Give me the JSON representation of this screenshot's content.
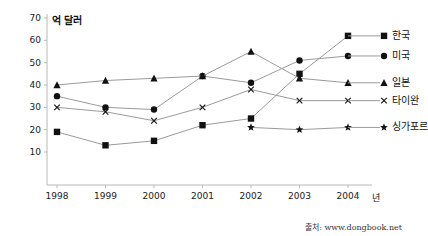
{
  "chart_data": {
    "type": "line",
    "title": "",
    "xlabel": "년",
    "ylabel": "억 달러",
    "x": [
      "1998",
      "1999",
      "2000",
      "2001",
      "2002",
      "2003",
      "2004"
    ],
    "ylim": [
      0,
      70
    ],
    "xlim": [
      "1998",
      "2004"
    ],
    "yticks": [
      10,
      20,
      30,
      40,
      50,
      60,
      70
    ],
    "grid": false,
    "legend_position": "right",
    "series": [
      {
        "name": "한국",
        "marker": "square",
        "values": [
          19,
          13,
          15,
          22,
          25,
          45,
          62
        ]
      },
      {
        "name": "미국",
        "marker": "circle",
        "values": [
          35,
          30,
          29,
          44,
          41,
          51,
          53
        ]
      },
      {
        "name": "일본",
        "marker": "triangle",
        "values": [
          40,
          42,
          43,
          44,
          55,
          43,
          41
        ]
      },
      {
        "name": "타이완",
        "marker": "cross",
        "values": [
          30,
          28,
          24,
          30,
          38,
          33,
          33
        ]
      },
      {
        "name": "싱가포르",
        "marker": "star",
        "values": [
          null,
          null,
          null,
          null,
          21,
          20,
          21
        ]
      }
    ],
    "source": "출처: www.dongbook.net"
  },
  "axis": {
    "unit_y": "억 달러",
    "unit_x": "년",
    "ytick_labels": [
      "70",
      "60",
      "50",
      "40",
      "30",
      "20",
      "10"
    ],
    "xtick_labels": [
      "1998",
      "1999",
      "2000",
      "2001",
      "2002",
      "2003",
      "2004"
    ]
  },
  "legend": {
    "items": [
      {
        "label": "한국"
      },
      {
        "label": "미국"
      },
      {
        "label": "일본"
      },
      {
        "label": "타이완"
      },
      {
        "label": "싱가포르"
      }
    ]
  },
  "colors": {
    "line": "#9a9a9a",
    "marker": "#111111",
    "axis": "#b8b8b8",
    "text": "#1a1a1a"
  },
  "footer": {
    "source": "출처: www.dongbook.net"
  }
}
